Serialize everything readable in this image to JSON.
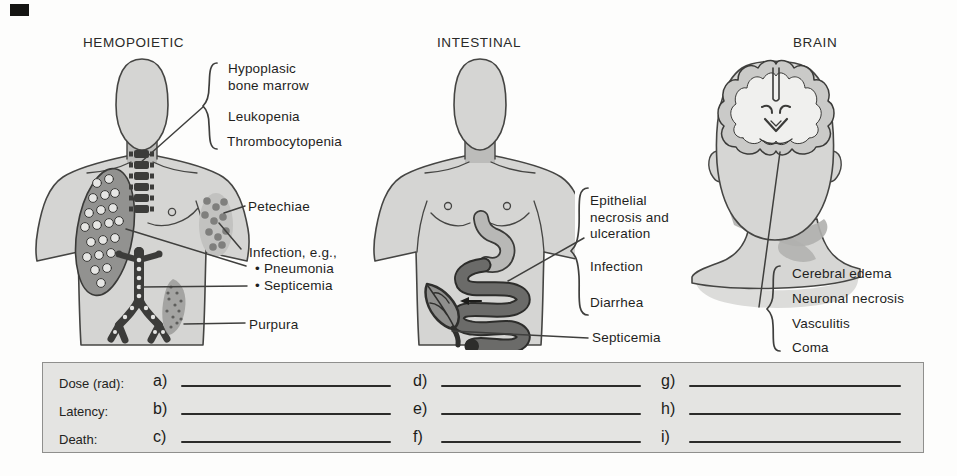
{
  "panels": [
    {
      "title": "HEMOPOIETIC",
      "labels": {
        "marrow": "Hypoplasic\nbone marrow",
        "leukopenia": "Leukopenia",
        "thrombocytopenia": "Thrombocytopenia",
        "petechiae": "Petechiae",
        "infection": "Infection, e.g.,",
        "pneumonia": "• Pneumonia",
        "septicemia": "• Septicemia",
        "purpura": "Purpura"
      }
    },
    {
      "title": "INTESTINAL",
      "labels": {
        "epithelial": "Epithelial\nnecrosis and\nulceration",
        "infection": "Infection",
        "diarrhea": "Diarrhea",
        "septicemia": "Septicemia"
      }
    },
    {
      "title": "BRAIN",
      "labels": {
        "cerebral_edema": "Cerebral edema",
        "neuronal_necrosis": "Neuronal necrosis",
        "vasculitis": "Vasculitis",
        "coma": "Coma"
      }
    }
  ],
  "worksheet": {
    "rows": [
      {
        "label": "Dose (rad):",
        "blanks": [
          {
            "letter": "a)"
          },
          {
            "letter": "d)"
          },
          {
            "letter": "g)"
          }
        ]
      },
      {
        "label": "Latency:",
        "blanks": [
          {
            "letter": "b)"
          },
          {
            "letter": "e)"
          },
          {
            "letter": "h)"
          }
        ]
      },
      {
        "label": "Death:",
        "blanks": [
          {
            "letter": "c)"
          },
          {
            "letter": "f)"
          },
          {
            "letter": "i)"
          }
        ]
      }
    ]
  },
  "palette": {
    "body_fill": "#d5d5d3",
    "outline": "#454543",
    "organ_dark": "#3a3a38",
    "intestine_gray": "#6b6b69",
    "shading_gray": "#b0b0ae",
    "sheet_fill": "#e4e4e2",
    "sheet_border": "#8f8f8d",
    "ink": "#1f1f1d"
  }
}
